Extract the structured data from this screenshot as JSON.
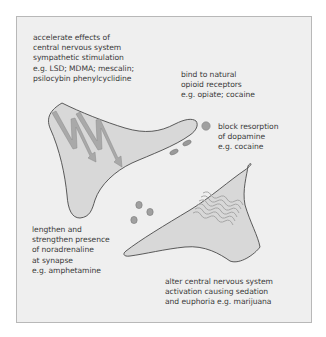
{
  "colors": {
    "background": "#ffffff",
    "panel": "#efefef",
    "panel_border": "#b8b8b8",
    "neuron_fill": "#d8d8d8",
    "neuron_outline": "#4a4a4a",
    "arrow_fill": "#a8a8a8",
    "vesicle_fill": "#9a9a9a",
    "wave_stroke": "#a0a0a0",
    "text": "#3a3a3a"
  },
  "labels": {
    "accelerate": "accelerate effects of\ncentral nervous system\nsympathetic stimulation\ne.g. LSD; MDMA; mescalin;\npsilocybin phenylcyclidine",
    "bind": "bind to natural\nopioid receptors\ne.g. opiate; cocaine",
    "block": "block resorption\nof dopamine\ne.g. cocaine",
    "lengthen": "lengthen and\nstrengthen presence\nof noradrenaline\nat synapse\ne.g. amphetamine",
    "alter": "alter central nervous system\nactivation causing sedation\nand euphoria e.g. marijuana"
  },
  "figures": {
    "upper_neuron": "presynaptic-neuron",
    "lower_neuron": "postsynaptic-neuron",
    "arrows": "nerve-impulse-arrows",
    "waves": "receptor-waves",
    "vesicles": "neurotransmitter-vesicles"
  }
}
